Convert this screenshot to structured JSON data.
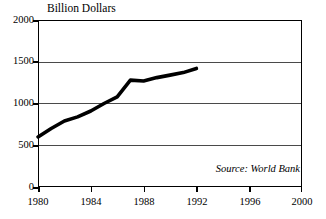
{
  "chart_data": {
    "type": "line",
    "title": "Billion Dollars",
    "xlabel": "",
    "ylabel": "Billion Dollars",
    "xlim": [
      1980,
      2000
    ],
    "ylim": [
      0,
      2000
    ],
    "grid": true,
    "legend": "none",
    "annotations": [
      "Source: World Bank"
    ],
    "x_ticks": [
      "1980",
      "1984",
      "1988",
      "1992",
      "1996",
      "2000"
    ],
    "x_tick_values": [
      1980,
      1984,
      1988,
      1992,
      1996,
      2000
    ],
    "y_ticks": [
      "0",
      "500",
      "1000",
      "1500",
      "2000"
    ],
    "y_tick_values": [
      0,
      500,
      1000,
      1500,
      2000
    ],
    "series": [
      {
        "name": "Billion Dollars",
        "x": [
          1980,
          1981,
          1982,
          1983,
          1984,
          1985,
          1986,
          1987,
          1988,
          1989,
          1990,
          1991,
          1992
        ],
        "values": [
          600,
          700,
          790,
          840,
          910,
          1000,
          1080,
          1280,
          1270,
          1310,
          1340,
          1370,
          1420
        ]
      }
    ]
  },
  "chart": {
    "title": "Billion Dollars",
    "source_note": "Source: World Bank",
    "axes": {
      "y_labels": [
        "2000",
        "1500",
        "1000",
        "500",
        "0"
      ],
      "x_labels": [
        "1980",
        "1984",
        "1988",
        "1992",
        "1996",
        "2000"
      ]
    },
    "colors": {
      "line": "#000000",
      "grid": "#4a4a4a",
      "frame": "#000000",
      "background": "#ffffff"
    }
  }
}
